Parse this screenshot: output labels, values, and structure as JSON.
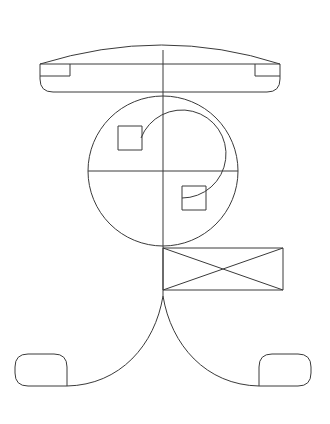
{
  "document": {
    "title": "Abstract line drawing",
    "background_color": "#ffffff",
    "stroke_color": "#3a3a3a",
    "stroke_width": 1,
    "width": 330,
    "height": 424
  },
  "chart_data": {
    "type": "line",
    "subtitle": "",
    "xlabel": "",
    "ylabel": "",
    "grid": false,
    "legend": null,
    "xlim": [
      0,
      330
    ],
    "ylim": [
      0,
      424
    ],
    "annotations": [],
    "shapes": [
      {
        "name": "top-bar-outline",
        "kind": "path",
        "description": "Wide horizontal capsule with an arched upper edge and rounded lower corners",
        "d": "M 40 64 L 40 79 Q 40 92 53 92 L 267 92 Q 280 92 280 79 L 280 64 Z M 40 64 Q 163 26 280 64"
      },
      {
        "name": "top-bar-left-notch",
        "kind": "polyline",
        "description": "Small square notch at left inside the top bar",
        "points": "40,76 70,76 70,64"
      },
      {
        "name": "top-bar-right-notch",
        "kind": "polyline",
        "description": "Small square notch at right inside the top bar",
        "points": "280,76 255,76 255,64"
      },
      {
        "name": "outer-circle",
        "kind": "circle",
        "cx": 163,
        "cy": 171,
        "r": 75
      },
      {
        "name": "inner-arc",
        "kind": "path",
        "description": "Nearly closed inner ring with a gap at the left, ends meeting the two small squares",
        "d": "M 141 138 A 44 44 0 1 1 182 198"
      },
      {
        "name": "upper-square",
        "kind": "rect",
        "x": 118,
        "y": 126,
        "width": 24,
        "height": 24
      },
      {
        "name": "lower-square",
        "kind": "rect",
        "x": 182,
        "y": 186,
        "width": 24,
        "height": 24
      },
      {
        "name": "horizontal-axis-line",
        "kind": "line",
        "x1": 88,
        "y1": 171,
        "x2": 238,
        "y2": 171
      },
      {
        "name": "vertical-axis-line",
        "kind": "line",
        "x1": 163,
        "y1": 50,
        "x2": 163,
        "y2": 296
      },
      {
        "name": "crossed-rectangle",
        "kind": "rect",
        "x": 163,
        "y": 248,
        "width": 120,
        "height": 42
      },
      {
        "name": "crossed-rectangle-diagonal-1",
        "kind": "line",
        "x1": 163,
        "y1": 248,
        "x2": 283,
        "y2": 290
      },
      {
        "name": "crossed-rectangle-diagonal-2",
        "kind": "line",
        "x1": 163,
        "y1": 290,
        "x2": 283,
        "y2": 248
      },
      {
        "name": "left-leg-curve",
        "kind": "path",
        "description": "Sweeping curve from the central junction down-left to the left foot",
        "d": "M 163 296 C 155 345 120 385 67 386"
      },
      {
        "name": "right-leg-curve",
        "kind": "path",
        "description": "Sweeping curve from the central junction down-right to the right foot",
        "d": "M 163 296 C 171 345 206 385 259 386"
      },
      {
        "name": "left-foot",
        "kind": "path",
        "description": "Rounded square foot at lower-left with a squared-off right edge",
        "d": "M 67 386 L 67 367 Q 67 354 54 354 L 28 354 Q 15 354 15 367 L 15 373 Q 15 386 28 386 Z"
      },
      {
        "name": "right-foot",
        "kind": "path",
        "description": "Rounded square foot at lower-right with a squared-off left edge",
        "d": "M 259 386 L 259 367 Q 259 354 272 354 L 298 354 Q 311 354 311 367 L 311 373 Q 311 386 298 386 Z"
      }
    ]
  }
}
